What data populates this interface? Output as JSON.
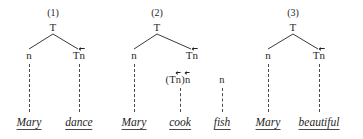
{
  "figure": {
    "type": "syntactic-tree-set",
    "count": 3,
    "background": "#ffffff",
    "ink": "#1f1f1f"
  },
  "trees": [
    {
      "number": "(1)",
      "root": "T",
      "left_node": "n",
      "right_node_base": "T",
      "right_node_barred": "n",
      "leaves": [
        "Mary",
        "dance"
      ],
      "has_lower_level": false
    },
    {
      "number": "(2)",
      "root": "T",
      "left_node": "n",
      "right_node_base": "T",
      "right_node_barred": "n",
      "lower_left_prefix": "(T",
      "lower_left_barred_inner": "n",
      "lower_left_mid": ")",
      "lower_left_barred_outer": "n",
      "lower_right_node": "n",
      "leaves": [
        "Mary",
        "cook",
        "fish"
      ],
      "has_lower_level": true
    },
    {
      "number": "(3)",
      "root": "T",
      "left_node": "n",
      "right_node_base": "T",
      "right_node_barred": "n",
      "leaves": [
        "Mary",
        "beautiful"
      ],
      "has_lower_level": false
    }
  ]
}
